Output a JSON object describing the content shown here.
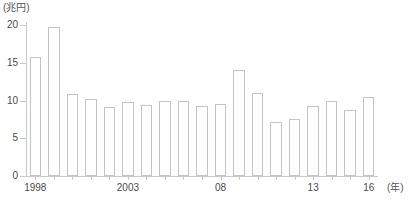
{
  "chart_data": {
    "type": "bar",
    "title": "",
    "subtitle": "",
    "ylabel": "(兆円)",
    "xlabel": "(年)",
    "ylim": [
      0,
      20
    ],
    "yticks": [
      0,
      5,
      10,
      15,
      20
    ],
    "ytick_labels": [
      "0",
      "5",
      "10",
      "15",
      "20"
    ],
    "grid": false,
    "legend": null,
    "categories": [
      "1998",
      "1999",
      "2000",
      "2001",
      "2002",
      "2003",
      "2004",
      "2005",
      "2006",
      "2007",
      "2008",
      "2009",
      "2010",
      "2011",
      "2012",
      "2013",
      "2014",
      "2015",
      "2016"
    ],
    "xtick_labels": [
      {
        "category": "1998",
        "label": "1998"
      },
      {
        "category": "2003",
        "label": "2003"
      },
      {
        "category": "2008",
        "label": "08"
      },
      {
        "category": "2013",
        "label": "13"
      },
      {
        "category": "2016",
        "label": "16"
      }
    ],
    "values": [
      15.8,
      19.8,
      10.8,
      10.2,
      9.2,
      9.8,
      9.4,
      10.0,
      9.9,
      9.3,
      9.5,
      14.0,
      11.0,
      7.1,
      7.5,
      9.3,
      9.9,
      8.8,
      10.4
    ],
    "bar_fill_color": "#ffffff",
    "bar_border_color": "#c4c4c4",
    "axis_color": "#c9c9c9",
    "text_color": "#4a4a4a"
  }
}
